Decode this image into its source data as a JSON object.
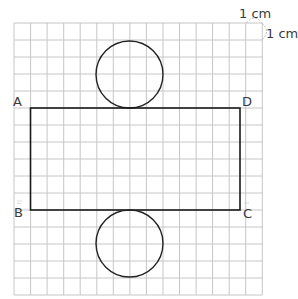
{
  "diagram": {
    "grid": {
      "columns": 15,
      "rows": 16,
      "cell_label": "1 cm",
      "line_color": "#c8c8c8"
    },
    "unit_labels": {
      "horizontal": "1 cm",
      "vertical": "1 cm"
    },
    "rectangle": {
      "vertices": {
        "top_left": "A",
        "top_right": "D",
        "bottom_left": "B",
        "bottom_right": "C"
      },
      "height_cells": 6,
      "stroke": "#1a1a1a"
    },
    "circles": [
      {
        "name": "top-base",
        "diameter_cells": 4
      },
      {
        "name": "bottom-base",
        "diameter_cells": 4
      }
    ],
    "labels": {
      "A": "A",
      "B": "B",
      "C": "C",
      "D": "D"
    }
  }
}
